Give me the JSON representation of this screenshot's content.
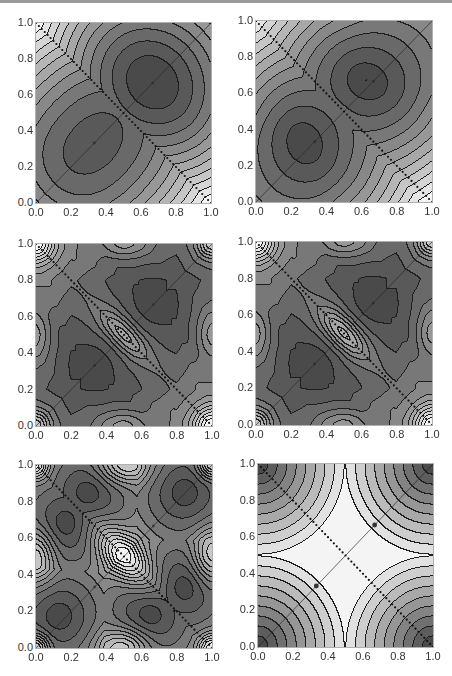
{
  "chart_data": [
    {
      "id": "panel-1",
      "type": "heatmap",
      "subtype": "contour",
      "title": "",
      "xlabel": "",
      "ylabel": "",
      "xlim": [
        0,
        1
      ],
      "ylim": [
        0,
        1
      ],
      "xticks": [
        "0.0",
        "0.2",
        "0.4",
        "0.6",
        "0.8",
        "1.0"
      ],
      "yticks": [
        "0.0",
        "0.2",
        "0.4",
        "0.6",
        "0.8",
        "1.0"
      ],
      "colormap": "grayscale (dark = low, light = high)",
      "description": "Two dark elliptical minima centered near (0.33,0.33) and (0.67,0.67); saddle at (0.5,0.5); light maxima in corners (0,1) and (1,0).",
      "overlays": [
        "solid diagonal y=x",
        "dotted anti-diagonal y=1-x"
      ],
      "minima": [
        [
          0.33,
          0.33
        ],
        [
          0.67,
          0.67
        ]
      ],
      "saddle": [
        0.5,
        0.5
      ],
      "mode": 1
    },
    {
      "id": "panel-2",
      "type": "heatmap",
      "subtype": "contour",
      "xlim": [
        0,
        1
      ],
      "ylim": [
        0,
        1
      ],
      "xticks": [
        "0.0",
        "0.2",
        "0.4",
        "0.6",
        "0.8",
        "1.0"
      ],
      "yticks": [
        "0.0",
        "0.2",
        "0.4",
        "0.6",
        "0.8",
        "1.0"
      ],
      "description": "Two dark triangular minima near (0.25,0.35) and (0.65,0.7); small lens-shaped maximum at center along anti-diagonal; light regions at corners (0,1), (1,0) and edge midpoints.",
      "overlays": [
        "solid diagonal y=x",
        "dotted anti-diagonal y=1-x"
      ],
      "minima": [
        [
          0.27,
          0.33
        ],
        [
          0.63,
          0.67
        ]
      ],
      "mode": 2
    },
    {
      "id": "panel-3",
      "type": "heatmap",
      "subtype": "contour",
      "xlim": [
        0,
        1
      ],
      "ylim": [
        0,
        1
      ],
      "xticks": [
        "0.0",
        "0.2",
        "0.4",
        "0.6",
        "0.8",
        "1.0"
      ],
      "yticks": [
        "0.0",
        "0.2",
        "0.4",
        "0.6",
        "0.8",
        "1.0"
      ],
      "description": "Two dark three-armed (Y-shaped) minima near (0.33,0.33) and (0.67,0.67); light lens maximum at center along anti-diagonal; light bulges at edge midpoints.",
      "overlays": [
        "solid diagonal y=x",
        "dotted anti-diagonal y=1-x"
      ],
      "minima": [
        [
          0.33,
          0.33
        ],
        [
          0.67,
          0.67
        ]
      ],
      "mode": 3
    },
    {
      "id": "panel-4",
      "type": "heatmap",
      "subtype": "contour",
      "xlim": [
        0,
        1
      ],
      "ylim": [
        0,
        1
      ],
      "xticks": [
        "0.0",
        "0.2",
        "0.4",
        "0.6",
        "0.8",
        "1.0"
      ],
      "yticks": [
        "0.0",
        "0.2",
        "0.4",
        "0.6",
        "0.8",
        "1.0"
      ],
      "description": "Similar to panel 3 with larger central lens maximum and thinner Y-shaped dark minima arms.",
      "overlays": [
        "solid diagonal y=x",
        "dotted anti-diagonal y=1-x"
      ],
      "minima": [
        [
          0.33,
          0.33
        ],
        [
          0.67,
          0.67
        ]
      ],
      "mode": 4
    },
    {
      "id": "panel-5",
      "type": "heatmap",
      "subtype": "contour",
      "xlim": [
        0,
        1
      ],
      "ylim": [
        0,
        1
      ],
      "xticks": [
        "0.0",
        "0.2",
        "0.4",
        "0.6",
        "0.8",
        "1.0"
      ],
      "yticks": [
        "0.0",
        "0.2",
        "0.4",
        "0.6",
        "0.8",
        "1.0"
      ],
      "description": "Six small dark minima around (0.13,0.17), (0.17,0.68), (0.3,0.85), (0.85,0.85), (0.85,0.33), (0.65,0.18); large light lens maximum at center; light bulges at edge midpoints.",
      "overlays": [
        "solid diagonal y=x",
        "dotted anti-diagonal y=1-x"
      ],
      "minima": [
        [
          0.13,
          0.17
        ],
        [
          0.17,
          0.68
        ],
        [
          0.3,
          0.85
        ],
        [
          0.85,
          0.85
        ],
        [
          0.85,
          0.33
        ],
        [
          0.65,
          0.18
        ]
      ],
      "mode": 5
    },
    {
      "id": "panel-6",
      "type": "heatmap",
      "subtype": "contour",
      "xlim": [
        0,
        1
      ],
      "ylim": [
        0,
        1
      ],
      "xticks": [
        "0.0",
        "0.2",
        "0.4",
        "0.6",
        "0.8",
        "1.0"
      ],
      "yticks": [
        "0.0",
        "0.2",
        "0.4",
        "0.6",
        "0.8",
        "1.0"
      ],
      "description": "Inverted pattern: dark regions at all four corners, light cross-shaped region through the center; marked points at (0.33,0.33) and (0.67,0.67) on diagonal.",
      "overlays": [
        "solid diagonal y=x",
        "dotted anti-diagonal y=1-x",
        "points (0.33,0.33), (0.67,0.67)"
      ],
      "points": [
        [
          0.33,
          0.33
        ],
        [
          0.67,
          0.67
        ]
      ],
      "mode": 6
    }
  ],
  "layout": {
    "panels": [
      {
        "x": 35,
        "y": 22,
        "w": 177,
        "h": 182
      },
      {
        "x": 255,
        "y": 20,
        "w": 178,
        "h": 183
      },
      {
        "x": 35,
        "y": 243,
        "w": 178,
        "h": 184
      },
      {
        "x": 255,
        "y": 241,
        "w": 178,
        "h": 185
      },
      {
        "x": 35,
        "y": 464,
        "w": 178,
        "h": 185
      },
      {
        "x": 257,
        "y": 463,
        "w": 177,
        "h": 185
      }
    ]
  },
  "colors": {
    "dark": "#4a4a4a",
    "light": "#f2f2f2",
    "contour_line": "#1e1e1e",
    "tick_text": "#333333"
  }
}
